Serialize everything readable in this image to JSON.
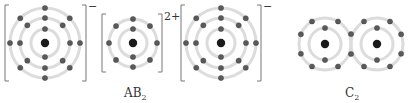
{
  "diagram": {
    "colors": {
      "shell": "#dcdcdc",
      "electron": "#5a5a5a",
      "nucleus": "#1a1a1a",
      "bracket": "#777777"
    },
    "species": [
      {
        "name": "anion-B-left",
        "charge": "−",
        "nucleus": [
          45,
          43
        ],
        "shells": [
          {
            "r": 14,
            "electrons": 2
          },
          {
            "r": 25,
            "electrons": 8
          },
          {
            "r": 35,
            "electrons": 8
          }
        ],
        "bracket": [
          5,
          5,
          86,
          81
        ]
      },
      {
        "name": "cation-A",
        "charge": "2+",
        "nucleus": [
          133,
          43
        ],
        "shells": [
          {
            "r": 14,
            "electrons": 2
          },
          {
            "r": 24,
            "electrons": 8
          }
        ],
        "bracket": [
          102,
          14,
          162,
          72
        ]
      },
      {
        "name": "anion-B-right",
        "charge": "−",
        "nucleus": [
          221,
          43
        ],
        "shells": [
          {
            "r": 14,
            "electrons": 2
          },
          {
            "r": 25,
            "electrons": 8
          },
          {
            "r": 35,
            "electrons": 8
          }
        ],
        "bracket": [
          181,
          5,
          261,
          81
        ]
      }
    ],
    "molecule": {
      "name": "C2",
      "nuclei": [
        [
          325,
          44
        ],
        [
          377,
          44
        ]
      ],
      "inner_r": 16,
      "outer_r": 26
    },
    "labels": {
      "ionic_base": "AB",
      "ionic_sub": "2",
      "covalent_base": "C",
      "covalent_sub": "2",
      "charge_minus": "−",
      "charge_two_plus": "2+"
    }
  }
}
